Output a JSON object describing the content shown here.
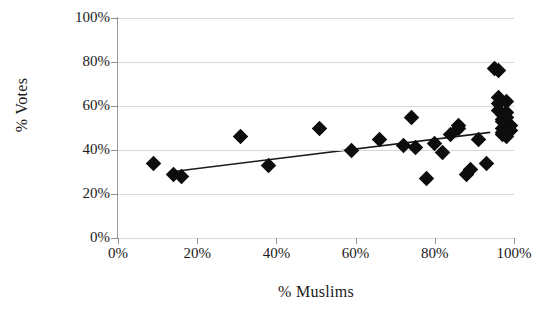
{
  "chart_data": {
    "type": "scatter",
    "title": "",
    "xlabel": "% Muslims",
    "ylabel": "% Votes",
    "xlim": [
      0,
      100
    ],
    "ylim": [
      0,
      100
    ],
    "xticks": [
      0,
      20,
      40,
      60,
      80,
      100
    ],
    "yticks": [
      0,
      20,
      40,
      60,
      80,
      100
    ],
    "xtick_labels": [
      "0%",
      "20%",
      "40%",
      "60%",
      "80%",
      "100%"
    ],
    "ytick_labels": [
      "0%",
      "20%",
      "40%",
      "60%",
      "80%",
      "100%"
    ],
    "grid": "horizontal",
    "legend": "none",
    "marker": "diamond",
    "marker_color": "#0d0d0d",
    "gridline_color": "#d8d8d8",
    "axis_color": "#8f8f8f",
    "series": [
      {
        "name": "Constituencies",
        "points": [
          [
            9,
            34
          ],
          [
            14,
            29
          ],
          [
            16,
            28
          ],
          [
            31,
            46
          ],
          [
            38,
            33
          ],
          [
            51,
            50
          ],
          [
            59,
            40
          ],
          [
            66,
            45
          ],
          [
            72,
            42
          ],
          [
            74,
            55
          ],
          [
            75,
            41
          ],
          [
            78,
            27
          ],
          [
            80,
            43
          ],
          [
            82,
            39
          ],
          [
            84,
            47
          ],
          [
            86,
            51
          ],
          [
            86,
            50
          ],
          [
            88,
            29
          ],
          [
            89,
            31
          ],
          [
            91,
            45
          ],
          [
            93,
            34
          ],
          [
            95,
            77
          ],
          [
            96,
            76
          ],
          [
            96,
            64
          ],
          [
            96,
            61
          ],
          [
            96,
            58
          ],
          [
            97,
            56
          ],
          [
            97,
            54
          ],
          [
            97,
            53
          ],
          [
            97,
            50
          ],
          [
            97,
            48
          ],
          [
            97,
            47
          ],
          [
            98,
            62
          ],
          [
            98,
            57
          ],
          [
            98,
            55
          ],
          [
            98,
            52
          ],
          [
            98,
            46
          ],
          [
            99,
            51
          ],
          [
            99,
            49
          ]
        ]
      }
    ],
    "trendline": {
      "type": "linear",
      "x_start": 13,
      "y_start": 30,
      "x_end": 94,
      "y_end": 48,
      "color": "#1a1a1a"
    }
  }
}
